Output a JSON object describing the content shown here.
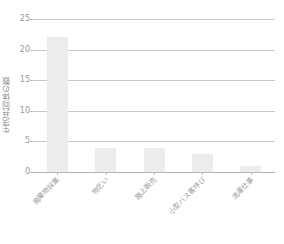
{
  "chart_data": {
    "type": "bar",
    "title": "",
    "xlabel": "",
    "ylabel": "生活共同体の数",
    "categories": [
      "廃棄物採集",
      "物乞い",
      "路上販売",
      "小型バス客呼び",
      "洗濯仕事"
    ],
    "values": [
      22,
      4,
      4,
      3,
      1
    ],
    "ylim": [
      0,
      25
    ],
    "yticks": [
      0,
      5,
      10,
      15,
      20,
      25
    ],
    "ytick_labels": [
      "0",
      "5",
      "10",
      "15",
      "20",
      "25"
    ],
    "grid": true,
    "legend": false,
    "legend_position": "none",
    "bar_color": "#ececec",
    "gridline_color": "#c9c9c9",
    "axis_color": "#b4b4b4",
    "text_color": "#9a9a9a",
    "background_color": "#ffffff"
  }
}
